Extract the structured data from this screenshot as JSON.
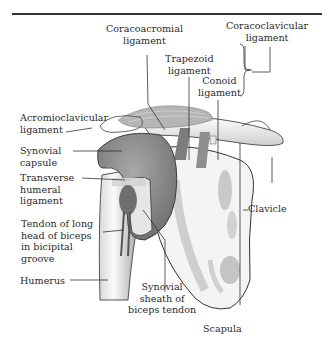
{
  "figure": {
    "type": "anatomical-diagram",
    "labels": {
      "coracoacromial_ligament": "Coracoacromial\nligament",
      "coracoclavicular_ligament": "Coracoclavicular\nligament",
      "trapezoid_ligament": "Trapezoid\nligament",
      "conoid_ligament": "Conoid\nligament",
      "acromioclavicular_ligament": "Acromioclavicular\nligament",
      "synovial_capsule": "Synovial\ncapsule",
      "transverse_humeral_ligament": "Transverse\nhumeral\nligament",
      "tendon_long_head_biceps": "Tendon of long\nhead of biceps\nin bicipital\ngroove",
      "humerus": "Humerus",
      "clavicle": "Clavicle",
      "synovial_sheath": "Synovial\nsheath of\nbiceps tendon",
      "scapula": "Scapula"
    },
    "caption": "Fig. ... (clipped at bottom edge)",
    "colors": {
      "capsule": "#8a8a8a",
      "bone": "#f2f2f2",
      "bone_shade": "#c8c8c8",
      "ligament": "#9e9e9e",
      "line": "#333333"
    }
  }
}
